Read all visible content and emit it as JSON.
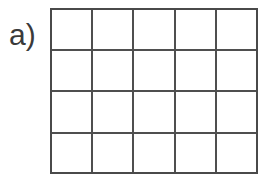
{
  "figure": {
    "panel_label": "a)",
    "background_color": "#ffffff",
    "line_color": "#4f4f4f",
    "border_color": "#4a4a4a",
    "label_color": "#3a3a3a"
  },
  "chart_data": {
    "type": "table",
    "title": "a)",
    "columns": 5,
    "rows": 4,
    "cell_values": [
      [
        "",
        "",
        "",
        "",
        ""
      ],
      [
        "",
        "",
        "",
        "",
        ""
      ],
      [
        "",
        "",
        "",
        "",
        ""
      ],
      [
        "",
        "",
        "",
        "",
        ""
      ]
    ],
    "column_headers": [],
    "row_headers": [],
    "grid": true,
    "legend": [],
    "annotations": [
      {
        "text": "a)",
        "position": "left-of-grid"
      }
    ],
    "xlabel": "",
    "ylabel": "",
    "geometry": {
      "grid_left": 50,
      "grid_top": 8,
      "grid_width": 208,
      "grid_height": 166,
      "column_x": [
        0,
        41.6,
        83.2,
        124.8,
        166.4,
        208
      ],
      "row_y": [
        0,
        41.5,
        83,
        124.5,
        166
      ]
    }
  }
}
